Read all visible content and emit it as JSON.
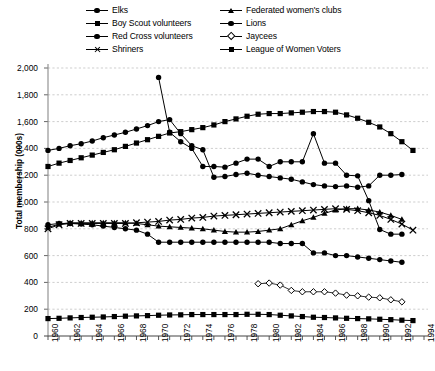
{
  "chart_data": {
    "type": "line",
    "title": "",
    "xlabel": "",
    "ylabel": "Total membership (000s)",
    "xlim": [
      1960,
      1994
    ],
    "ylim": [
      0,
      2000
    ],
    "ytick_step": 200,
    "grid": true,
    "legend_position": "top",
    "x_tick_labels": [
      "1960",
      "1962",
      "1964",
      "1966",
      "1968",
      "1970",
      "1972",
      "1974",
      "1976",
      "1978",
      "1980",
      "1982",
      "1984",
      "1986",
      "1988",
      "1990",
      "1992",
      "1994"
    ],
    "y_tick_labels": [
      "0",
      "200",
      "400",
      "600",
      "800",
      "1,000",
      "1,200",
      "1,400",
      "1,600",
      "1,800",
      "2,000"
    ],
    "series": [
      {
        "name": "Elks",
        "marker": "circle",
        "x": [
          1960,
          1961,
          1962,
          1963,
          1964,
          1965,
          1966,
          1967,
          1968,
          1969,
          1970,
          1971,
          1972,
          1973,
          1974,
          1975,
          1976,
          1977,
          1978,
          1979,
          1980,
          1981,
          1982,
          1983,
          1984,
          1985,
          1986,
          1987,
          1988,
          1989,
          1990,
          1991,
          1992
        ],
        "values": [
          1385,
          1400,
          1420,
          1435,
          1455,
          1480,
          1500,
          1520,
          1545,
          1570,
          1600,
          1615,
          1510,
          1420,
          1390,
          1185,
          1190,
          1205,
          1215,
          1200,
          1190,
          1180,
          1170,
          1150,
          1130,
          1120,
          1115,
          1120,
          1110,
          1120,
          1200,
          1200,
          1205
        ]
      },
      {
        "name": "Boy Scout volunteers",
        "marker": "square",
        "x": [
          1960,
          1961,
          1962,
          1963,
          1964,
          1965,
          1966,
          1967,
          1968,
          1969,
          1970,
          1971,
          1972,
          1973,
          1974,
          1975,
          1976,
          1977,
          1978,
          1979,
          1980,
          1981,
          1982,
          1983,
          1984,
          1985,
          1986,
          1987,
          1988,
          1989,
          1990,
          1991,
          1992,
          1993
        ],
        "values": [
          1265,
          1290,
          1310,
          1330,
          1350,
          1370,
          1390,
          1415,
          1440,
          1465,
          1490,
          1515,
          1525,
          1540,
          1555,
          1575,
          1600,
          1620,
          1640,
          1655,
          1660,
          1660,
          1665,
          1670,
          1675,
          1675,
          1670,
          1650,
          1625,
          1595,
          1560,
          1510,
          1450,
          1385
        ]
      },
      {
        "name": "Red Cross volunteers",
        "marker": "circle",
        "x": [
          1970,
          1971,
          1972,
          1973,
          1974,
          1975,
          1976,
          1977,
          1978,
          1979,
          1980,
          1981,
          1982,
          1983,
          1984,
          1985,
          1986,
          1987,
          1988,
          1989,
          1990,
          1991,
          1992
        ],
        "values": [
          1930,
          1520,
          1450,
          1400,
          1265,
          1265,
          1260,
          1290,
          1320,
          1320,
          1265,
          1300,
          1300,
          1300,
          1510,
          1290,
          1290,
          1200,
          1195,
          1010,
          795,
          760,
          760
        ]
      },
      {
        "name": "Shriners",
        "marker": "x",
        "x": [
          1960,
          1961,
          1962,
          1963,
          1964,
          1965,
          1966,
          1967,
          1968,
          1969,
          1970,
          1971,
          1972,
          1973,
          1974,
          1975,
          1976,
          1977,
          1978,
          1979,
          1980,
          1981,
          1982,
          1983,
          1984,
          1985,
          1986,
          1987,
          1988,
          1989,
          1990,
          1991,
          1992,
          1993
        ],
        "values": [
          800,
          830,
          840,
          840,
          840,
          840,
          840,
          840,
          845,
          850,
          855,
          865,
          870,
          880,
          885,
          895,
          900,
          905,
          910,
          915,
          920,
          925,
          930,
          935,
          940,
          945,
          950,
          945,
          935,
          920,
          900,
          870,
          835,
          790
        ]
      },
      {
        "name": "Federated women's clubs",
        "marker": "triangle",
        "x": [
          1960,
          1961,
          1962,
          1963,
          1964,
          1965,
          1966,
          1967,
          1968,
          1969,
          1970,
          1971,
          1972,
          1973,
          1974,
          1975,
          1976,
          1977,
          1978,
          1979,
          1980,
          1981,
          1982,
          1983,
          1984,
          1985,
          1986,
          1987,
          1988,
          1989,
          1990,
          1991,
          1992
        ],
        "values": [
          810,
          835,
          845,
          845,
          845,
          845,
          845,
          845,
          840,
          830,
          820,
          815,
          810,
          805,
          800,
          790,
          780,
          775,
          775,
          780,
          790,
          800,
          830,
          860,
          885,
          915,
          940,
          950,
          950,
          940,
          925,
          900,
          870
        ]
      },
      {
        "name": "Lions",
        "marker": "circle",
        "x": [
          1960,
          1961,
          1962,
          1963,
          1964,
          1965,
          1966,
          1967,
          1968,
          1969,
          1970,
          1971,
          1972,
          1973,
          1974,
          1975,
          1976,
          1977,
          1978,
          1979,
          1980,
          1981,
          1982,
          1983,
          1984,
          1985,
          1986,
          1987,
          1988,
          1989,
          1990,
          1991,
          1992
        ],
        "values": [
          830,
          840,
          840,
          835,
          830,
          820,
          810,
          800,
          790,
          760,
          700,
          700,
          700,
          700,
          700,
          700,
          700,
          700,
          700,
          700,
          700,
          690,
          690,
          690,
          620,
          620,
          600,
          600,
          590,
          580,
          570,
          560,
          550
        ]
      },
      {
        "name": "Jaycees",
        "marker": "diamond",
        "x": [
          1979,
          1980,
          1981,
          1982,
          1983,
          1984,
          1985,
          1986,
          1987,
          1988,
          1989,
          1990,
          1991,
          1992
        ],
        "values": [
          390,
          395,
          380,
          340,
          330,
          330,
          330,
          320,
          305,
          300,
          290,
          285,
          270,
          255
        ]
      },
      {
        "name": "League of Women Voters",
        "marker": "square",
        "x": [
          1960,
          1961,
          1962,
          1963,
          1964,
          1965,
          1966,
          1967,
          1968,
          1969,
          1970,
          1971,
          1972,
          1973,
          1974,
          1975,
          1976,
          1977,
          1978,
          1979,
          1980,
          1981,
          1982,
          1983,
          1984,
          1985,
          1986,
          1987,
          1988,
          1989,
          1990,
          1991,
          1992,
          1993
        ],
        "values": [
          130,
          132,
          135,
          138,
          140,
          142,
          145,
          148,
          150,
          152,
          155,
          157,
          158,
          160,
          160,
          160,
          160,
          160,
          162,
          162,
          160,
          155,
          150,
          145,
          140,
          138,
          135,
          132,
          130,
          128,
          125,
          122,
          118,
          115
        ]
      }
    ]
  },
  "legend": {
    "column1": [
      {
        "label": "Elks",
        "marker": "circle"
      },
      {
        "label": "Boy Scout volunteers",
        "marker": "square"
      },
      {
        "label": "Red Cross volunteers",
        "marker": "circle"
      },
      {
        "label": "Shriners",
        "marker": "x"
      }
    ],
    "column2": [
      {
        "label": "Federated women's clubs",
        "marker": "triangle"
      },
      {
        "label": "Lions",
        "marker": "circle"
      },
      {
        "label": "Jaycees",
        "marker": "diamond"
      },
      {
        "label": "League of Women Voters",
        "marker": "square"
      }
    ]
  },
  "colors": {
    "line": "#000000",
    "grid": "#b9b9b9",
    "axis": "#8a8a8a",
    "background": "#ffffff"
  }
}
